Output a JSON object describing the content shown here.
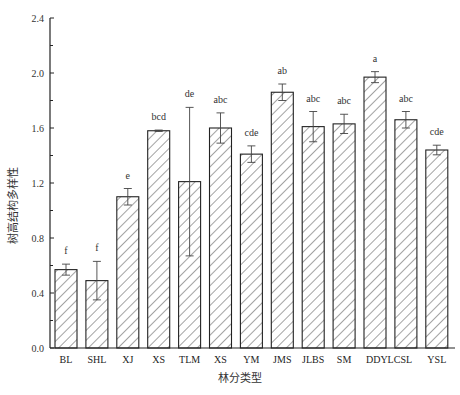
{
  "chart_data": {
    "type": "bar",
    "title": "",
    "xlabel": "林分类型",
    "ylabel": "树高结构多样性",
    "ylim": [
      0,
      2.4
    ],
    "yticks": [
      0.0,
      0.4,
      0.8,
      1.2,
      1.6,
      2.0,
      2.4
    ],
    "ytick_labels": [
      "0.0",
      "0.4",
      "0.8",
      "1.2",
      "1.6",
      "2.0",
      "2.4"
    ],
    "grid": false,
    "legend": null,
    "bar_style": "hatched (diagonal), black outline, white fill",
    "categories": [
      "BL",
      "SHL",
      "XJ",
      "XS",
      "TLM",
      "XS",
      "YM",
      "JMS",
      "JLBS",
      "SM",
      "DDYLCSL",
      "",
      "YSL"
    ],
    "category_labels_display": [
      "BL",
      "SHL",
      "XJ",
      "XS",
      "TLM",
      "XS",
      "YM",
      "JMS",
      "JLBS",
      "SM",
      "DDYLCSL",
      "YSL"
    ],
    "values": [
      0.57,
      0.49,
      1.1,
      1.58,
      1.21,
      1.6,
      1.41,
      1.86,
      1.61,
      1.63,
      1.97,
      1.66,
      1.44
    ],
    "error": [
      0.04,
      0.14,
      0.06,
      0.005,
      0.54,
      0.11,
      0.06,
      0.06,
      0.11,
      0.07,
      0.04,
      0.06,
      0.035
    ],
    "significance_letters": [
      "f",
      "f",
      "e",
      "bcd",
      "de",
      "abc",
      "cde",
      "ab",
      "abc",
      "abc",
      "a",
      "abc",
      "cde"
    ]
  }
}
